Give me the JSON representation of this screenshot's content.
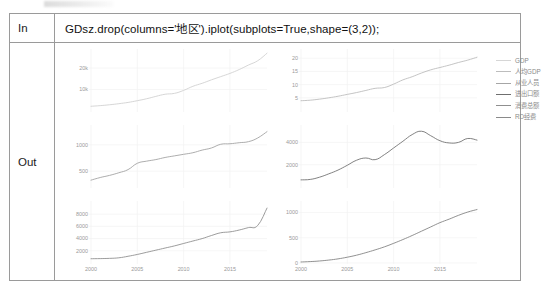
{
  "notebook": {
    "in_label": "In",
    "out_label": "Out",
    "code": "GDsz.drop(columns='地区').iplot(subplots=True,shape=(3,2));"
  },
  "legend": {
    "position": "right",
    "items": [
      {
        "label": "GDP",
        "color": "#d6d6d6",
        "width": 0.9
      },
      {
        "label": "人均GDP",
        "color": "#bdbdbd",
        "width": 1.0
      },
      {
        "label": "从业人员",
        "color": "#a6a6a6",
        "width": 1.1
      },
      {
        "label": "进出口额",
        "color": "#6f6f6f",
        "width": 1.5
      },
      {
        "label": "消费总额",
        "color": "#8f8f8f",
        "width": 1.1
      },
      {
        "label": "RD经费",
        "color": "#8a8a8a",
        "width": 1.1
      }
    ]
  },
  "chart_data": [
    {
      "id": "gdp",
      "type": "line",
      "title": "",
      "xlabel": "",
      "ylabel": "",
      "series_name": "GDP",
      "color": "#cfcfcf",
      "grid": true,
      "xlim": [
        2000,
        2019
      ],
      "ylim": [
        0,
        27000
      ],
      "yticks": [
        10000,
        20000
      ],
      "ytick_labels": [
        "10k",
        "20k"
      ],
      "xticks": [
        2000,
        2005,
        2010,
        2015
      ],
      "xtick_labels": [],
      "x": [
        2000,
        2001,
        2002,
        2003,
        2004,
        2005,
        2006,
        2007,
        2008,
        2009,
        2010,
        2011,
        2012,
        2013,
        2014,
        2015,
        2016,
        2017,
        2018,
        2019
      ],
      "values": [
        2200,
        2500,
        2900,
        3400,
        4000,
        4800,
        5700,
        6800,
        7800,
        8200,
        9600,
        11500,
        12900,
        14500,
        16000,
        17500,
        19300,
        21400,
        23400,
        26900
      ]
    },
    {
      "id": "per-capita-gdp",
      "type": "line",
      "title": "",
      "xlabel": "",
      "ylabel": "",
      "series_name": "人均GDP",
      "color": "#b9b9b9",
      "grid": true,
      "xlim": [
        2000,
        2019
      ],
      "ylim": [
        0,
        22
      ],
      "yticks": [
        5,
        10,
        15,
        20
      ],
      "ytick_labels": [
        "5",
        "10",
        "15",
        "20"
      ],
      "xticks": [
        2000,
        2005,
        2010,
        2015
      ],
      "xtick_labels": [],
      "x": [
        2000,
        2001,
        2002,
        2003,
        2004,
        2005,
        2006,
        2007,
        2008,
        2009,
        2010,
        2011,
        2012,
        2013,
        2014,
        2015,
        2016,
        2017,
        2018,
        2019
      ],
      "values": [
        3.9,
        4.1,
        4.5,
        5.0,
        5.6,
        6.3,
        7.0,
        7.8,
        8.6,
        8.9,
        10.2,
        11.8,
        13.0,
        14.4,
        15.6,
        16.5,
        17.4,
        18.4,
        19.3,
        20.4
      ]
    },
    {
      "id": "employees",
      "type": "line",
      "title": "",
      "xlabel": "",
      "ylabel": "",
      "series_name": "从业人员",
      "color": "#9e9e9e",
      "grid": true,
      "xlim": [
        2000,
        2019
      ],
      "ylim": [
        200,
        1300
      ],
      "yticks": [
        500,
        1000
      ],
      "ytick_labels": [
        "500",
        "1000"
      ],
      "xticks": [
        2000,
        2005,
        2010,
        2015
      ],
      "xtick_labels": [],
      "x": [
        2000,
        2001,
        2002,
        2003,
        2004,
        2005,
        2006,
        2007,
        2008,
        2009,
        2010,
        2011,
        2012,
        2013,
        2014,
        2015,
        2016,
        2017,
        2018,
        2019
      ],
      "values": [
        330,
        380,
        420,
        470,
        530,
        650,
        690,
        720,
        760,
        790,
        820,
        850,
        900,
        940,
        1010,
        1020,
        1040,
        1060,
        1130,
        1250
      ]
    },
    {
      "id": "import-export",
      "type": "line",
      "title": "",
      "xlabel": "",
      "ylabel": "",
      "series_name": "进出口额",
      "color": "#6b6b6b",
      "grid": true,
      "xlim": [
        2000,
        2019
      ],
      "ylim": [
        0,
        5200
      ],
      "yticks": [
        2000,
        4000
      ],
      "ytick_labels": [
        "2000",
        "4000"
      ],
      "xticks": [
        2000,
        2005,
        2010,
        2015
      ],
      "xtick_labels": [],
      "x": [
        2000,
        2001,
        2002,
        2003,
        2004,
        2005,
        2006,
        2007,
        2008,
        2009,
        2010,
        2011,
        2012,
        2013,
        2014,
        2015,
        2016,
        2017,
        2018,
        2019
      ],
      "values": [
        640,
        680,
        880,
        1180,
        1520,
        1950,
        2400,
        2600,
        2450,
        2900,
        3500,
        4100,
        4700,
        5000,
        4600,
        4150,
        3950,
        4000,
        4350,
        4200
      ]
    },
    {
      "id": "consumption",
      "type": "line",
      "title": "",
      "xlabel": "",
      "ylabel": "",
      "series_name": "消费总额",
      "color": "#8a8a8a",
      "grid": true,
      "xlim": [
        2000,
        2019
      ],
      "ylim": [
        0,
        9500
      ],
      "yticks": [
        2000,
        4000,
        6000,
        8000
      ],
      "ytick_labels": [
        "2000",
        "4000",
        "6000",
        "8000"
      ],
      "xticks": [
        2000,
        2005,
        2010,
        2015
      ],
      "xtick_labels": [
        "2000",
        "2005",
        "2010",
        "2015"
      ],
      "x": [
        2000,
        2001,
        2002,
        2003,
        2004,
        2005,
        2006,
        2007,
        2008,
        2009,
        2010,
        2011,
        2012,
        2013,
        2014,
        2015,
        2016,
        2017,
        2018,
        2019
      ],
      "values": [
        700,
        720,
        760,
        850,
        1100,
        1400,
        1750,
        2100,
        2450,
        2800,
        3200,
        3600,
        4000,
        4500,
        4950,
        5100,
        5400,
        5800,
        6150,
        9000
      ]
    },
    {
      "id": "rd-funding",
      "type": "line",
      "title": "",
      "xlabel": "",
      "ylabel": "",
      "series_name": "RD经费",
      "color": "#7d7d7d",
      "grid": true,
      "xlim": [
        2000,
        2019
      ],
      "ylim": [
        0,
        1150
      ],
      "yticks": [
        0,
        500,
        1000
      ],
      "ytick_labels": [
        "0",
        "500",
        "1000"
      ],
      "xticks": [
        2000,
        2005,
        2010,
        2015
      ],
      "xtick_labels": [
        "2000",
        "2005",
        "2010",
        "2015"
      ],
      "x": [
        2000,
        2001,
        2002,
        2003,
        2004,
        2005,
        2006,
        2007,
        2008,
        2009,
        2010,
        2011,
        2012,
        2013,
        2014,
        2015,
        2016,
        2017,
        2018,
        2019
      ],
      "values": [
        20,
        28,
        40,
        58,
        82,
        115,
        155,
        205,
        260,
        320,
        390,
        465,
        545,
        630,
        715,
        800,
        870,
        945,
        1010,
        1060
      ]
    }
  ]
}
